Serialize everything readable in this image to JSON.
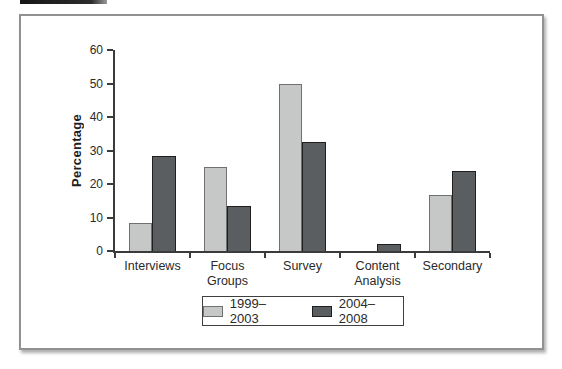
{
  "top_strip": {
    "color": "#161616"
  },
  "frame": {
    "border_color": "#919191",
    "background": "#ffffff",
    "shadow": "rgba(110,110,110,0.55)"
  },
  "axis": {
    "color": "#3b3b3b",
    "text_color": "#2a2a2a"
  },
  "chart_data": {
    "type": "bar",
    "title": "",
    "categories": [
      "Interviews",
      "Focus Groups",
      "Survey",
      "Content Analysis",
      "Secondary"
    ],
    "series": [
      {
        "name": "1999–2003",
        "values": [
          8.3,
          25,
          50,
          0,
          16.7
        ],
        "color": "#c6c8c7",
        "border_color": "#707070"
      },
      {
        "name": "2004–2008",
        "values": [
          28.3,
          13.5,
          32.5,
          2,
          24
        ],
        "color": "#5a5e60",
        "border_color": "#1f1f1f"
      }
    ],
    "xlabel": "",
    "ylabel": "Percentage",
    "ylim": [
      0,
      60
    ],
    "yticks": [
      0,
      10,
      20,
      30,
      40,
      50,
      60
    ],
    "grid": false,
    "legend_position": "bottom"
  }
}
